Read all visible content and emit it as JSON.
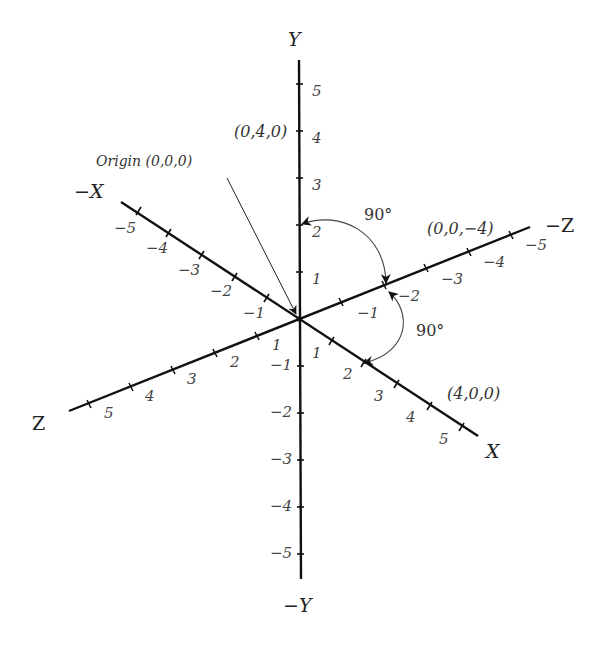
{
  "axes": {
    "y_pos": "Y",
    "y_neg": "−Y",
    "x_pos": "X",
    "x_neg": "−X",
    "z_pos": "Z",
    "z_neg": "−Z"
  },
  "ticks": {
    "y_pos": [
      "1",
      "2",
      "3",
      "4",
      "5"
    ],
    "y_neg": [
      "−1",
      "−2",
      "−3",
      "−4",
      "−5"
    ],
    "x_pos": [
      "1",
      "2",
      "3",
      "4",
      "5"
    ],
    "x_neg": [
      "−1",
      "−2",
      "−3",
      "−4",
      "−5"
    ],
    "z_pos": [
      "1",
      "2",
      "3",
      "4",
      "5"
    ],
    "z_neg": [
      "−1",
      "−2",
      "−3",
      "−4",
      "−5"
    ]
  },
  "points": {
    "origin": "Origin (0,0,0)",
    "y4": "(0,4,0)",
    "x4": "(4,0,0)",
    "zneg4": "(0,0,−4)"
  },
  "angles": {
    "y_to_zneg": "90°",
    "zneg_to_x": "90°"
  },
  "colors": {
    "axis": "#111111",
    "text": "#333333",
    "background": "#ffffff"
  }
}
